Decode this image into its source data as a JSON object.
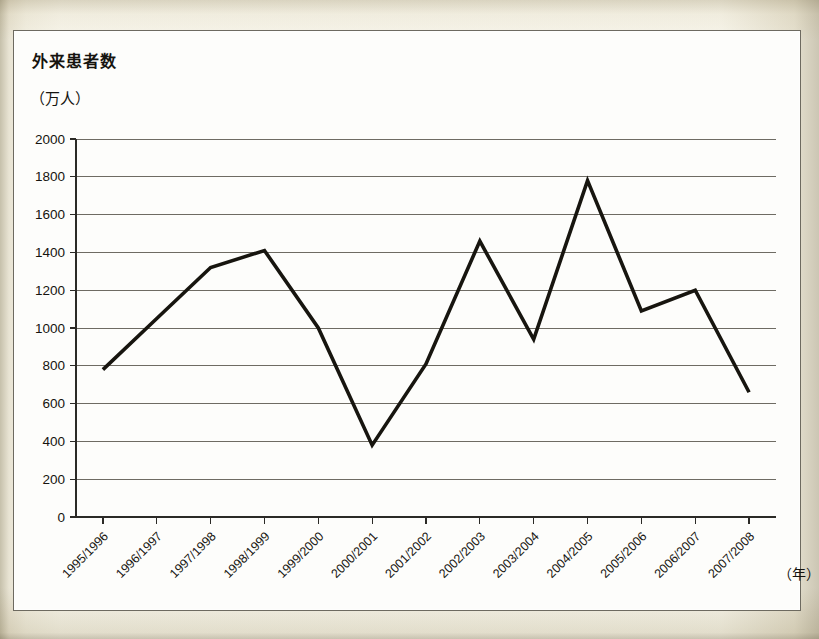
{
  "figure": {
    "title": "外来患者数",
    "unit_label": "（万人）",
    "xaxis_unit": "（年）"
  },
  "chart_data": {
    "type": "line",
    "title": "外来患者数",
    "ylabel": "（万人）",
    "xlabel": "（年）",
    "ylim": [
      0,
      2000
    ],
    "ytick_step": 200,
    "grid": true,
    "legend": "none",
    "categories": [
      "1995/1996",
      "1996/1997",
      "1997/1998",
      "1998/1999",
      "1999/2000",
      "2000/2001",
      "2001/2002",
      "2002/2003",
      "2003/2004",
      "2004/2005",
      "2005/2006",
      "2006/2007",
      "2007/2008"
    ],
    "ytick_labels": [
      "0",
      "200",
      "400",
      "600",
      "800",
      "1000",
      "1200",
      "1400",
      "1600",
      "1800",
      "2000"
    ],
    "series": [
      {
        "name": "外来患者数",
        "color": "#17150f",
        "values": [
          780,
          1050,
          1320,
          1410,
          1000,
          380,
          810,
          1460,
          940,
          1780,
          1090,
          1200,
          660
        ]
      }
    ]
  }
}
